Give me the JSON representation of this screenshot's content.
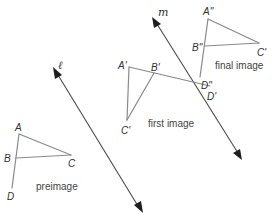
{
  "diagram": {
    "lines": [
      {
        "name": "l",
        "label": "ℓ"
      },
      {
        "name": "m",
        "label": "m"
      }
    ],
    "figures": {
      "preimage": {
        "caption": "preimage",
        "points": {
          "A": "A",
          "B": "B",
          "C": "C",
          "D": "D"
        }
      },
      "first_image": {
        "caption": "first image",
        "points": {
          "A": "A'",
          "B": "B'",
          "C": "C'",
          "D": "D'"
        }
      },
      "final_image": {
        "caption": "final image",
        "points": {
          "A": "A\"",
          "B": "B\"",
          "C": "C'",
          "D": "D\""
        }
      }
    },
    "colors": {
      "segments": "#8a8a8a",
      "axes": "#4a4a4a",
      "arrowheads": "#1e1e1e",
      "text": "#333333"
    }
  }
}
